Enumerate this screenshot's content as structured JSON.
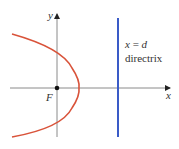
{
  "diagram": {
    "axes": {
      "x_label": "x",
      "y_label": "y",
      "color": "#8a8a8a"
    },
    "focus": {
      "label": "F",
      "color": "#111111"
    },
    "parabola": {
      "color": "#d9533a",
      "opens": "left"
    },
    "directrix": {
      "equation_var": "x",
      "equation_eq": " = ",
      "equation_val": "d",
      "label": "directrix",
      "color": "#3a5bc7"
    }
  }
}
